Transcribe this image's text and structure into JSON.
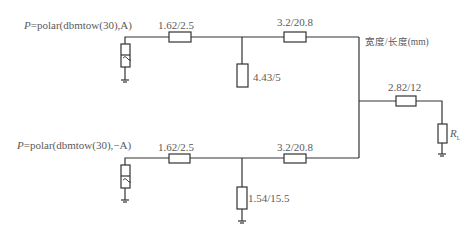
{
  "diagram": {
    "type": "circuit-schematic",
    "sources": [
      {
        "id": "source-top",
        "prefix": "P",
        "expression": "=polar(dbmtow(30),A)"
      },
      {
        "id": "source-bottom",
        "prefix": "P",
        "expression": "=polar(dbmtow(30),−A)"
      }
    ],
    "components": {
      "top_series_1": "1.62/2.5",
      "top_shunt": "4.43/5",
      "top_series_2": "3.2/20.8",
      "bottom_series_1": "1.62/2.5",
      "bottom_shunt": "1.54/15.5",
      "bottom_series_2": "3.2/20.8",
      "output_series": "2.82/12",
      "load": {
        "symbol": "R",
        "subscript": "L"
      }
    },
    "units_label": "宽度/长度(mm)"
  }
}
